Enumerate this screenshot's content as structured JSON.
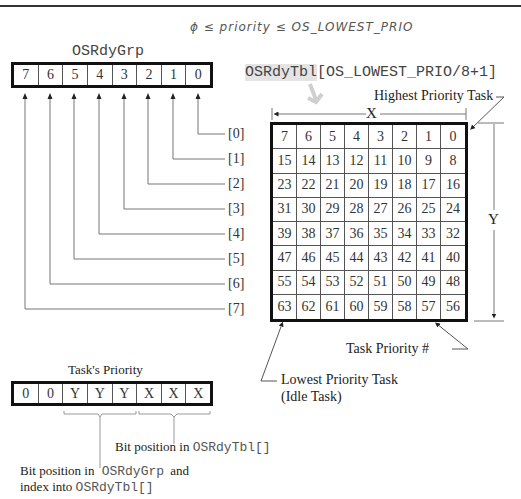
{
  "header_annotation": "ϕ ≤ priority ≤ OS_LOWEST_PRIO",
  "ready_group": {
    "title": "OSRdyGrp",
    "bits": [
      "7",
      "6",
      "5",
      "4",
      "3",
      "2",
      "1",
      "0"
    ]
  },
  "ready_table": {
    "title_prefix": "OSRdyTbl",
    "title_suffix": "[OS_LOWEST_PRIO/8+1]",
    "row_labels": [
      "[0]",
      "[1]",
      "[2]",
      "[3]",
      "[4]",
      "[5]",
      "[6]",
      "[7]"
    ],
    "rows": [
      [
        "7",
        "6",
        "5",
        "4",
        "3",
        "2",
        "1",
        "0"
      ],
      [
        "15",
        "14",
        "13",
        "12",
        "11",
        "10",
        "9",
        "8"
      ],
      [
        "23",
        "22",
        "21",
        "20",
        "19",
        "18",
        "17",
        "16"
      ],
      [
        "31",
        "30",
        "29",
        "28",
        "27",
        "26",
        "25",
        "24"
      ],
      [
        "39",
        "38",
        "37",
        "36",
        "35",
        "34",
        "33",
        "32"
      ],
      [
        "47",
        "46",
        "45",
        "44",
        "43",
        "42",
        "41",
        "40"
      ],
      [
        "55",
        "54",
        "53",
        "52",
        "51",
        "50",
        "49",
        "48"
      ],
      [
        "63",
        "62",
        "61",
        "60",
        "59",
        "58",
        "57",
        "56"
      ]
    ],
    "x_label": "X",
    "y_label": "Y"
  },
  "callouts": {
    "highest": "Highest Priority Task",
    "task_priority": "Task Priority #",
    "lowest_line1": "Lowest Priority Task",
    "lowest_line2": "(Idle Task)"
  },
  "task_priority": {
    "title": "Task's Priority",
    "bits": [
      "0",
      "0",
      "Y",
      "Y",
      "Y",
      "X",
      "X",
      "X"
    ]
  },
  "explanations": {
    "x_text": "Bit position in ",
    "x_code": "OSRdyTbl[]",
    "y_text1": "Bit position in ",
    "y_code1": "OSRdyGrp",
    "y_text2": " and",
    "y_text3": "index into ",
    "y_code3": "OSRdyTbl[]"
  }
}
